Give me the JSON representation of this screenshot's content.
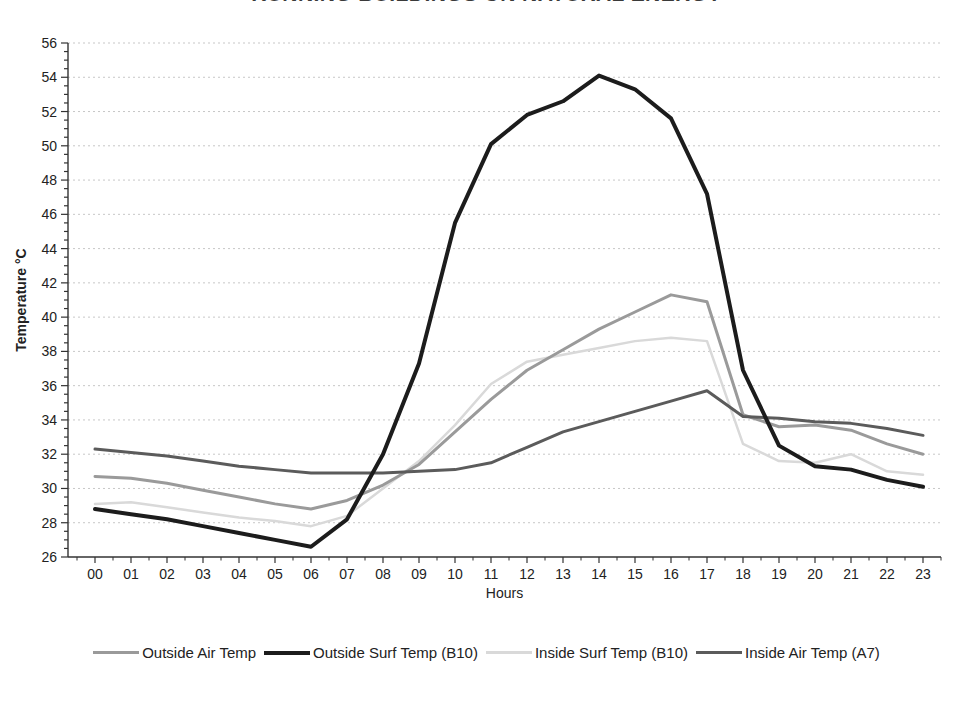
{
  "title": "RUNNING BUILDINGS ON NATURAL ENERGY",
  "chart_data": {
    "type": "line",
    "title": "RUNNING BUILDINGS ON NATURAL ENERGY",
    "xlabel": "Hours",
    "ylabel": "Temperature °C",
    "ylim": [
      26,
      56
    ],
    "ytick_step": 2,
    "yticks": [
      26,
      28,
      30,
      32,
      34,
      36,
      38,
      40,
      42,
      44,
      46,
      48,
      50,
      52,
      54,
      56
    ],
    "x": [
      "00",
      "01",
      "02",
      "03",
      "04",
      "05",
      "06",
      "07",
      "08",
      "09",
      "10",
      "11",
      "12",
      "13",
      "14",
      "15",
      "16",
      "17",
      "18",
      "19",
      "20",
      "21",
      "22",
      "23"
    ],
    "grid": "horizontal-dashed",
    "legend_position": "bottom",
    "colors": {
      "grid": "#c7c7c7",
      "axis": "#333333",
      "text": "#222222"
    },
    "series": [
      {
        "name": "Outside Air Temp",
        "color": "#9a9a9a",
        "width": 3,
        "values": [
          30.7,
          30.6,
          30.3,
          29.9,
          29.5,
          29.1,
          28.8,
          29.3,
          30.2,
          31.4,
          33.3,
          35.2,
          36.9,
          38.1,
          39.3,
          40.3,
          41.3,
          40.9,
          34.3,
          33.6,
          33.7,
          33.4,
          32.6,
          32.0
        ]
      },
      {
        "name": "Outside Surf Temp (B10)",
        "color": "#1c1c1c",
        "width": 4,
        "values": [
          28.8,
          28.5,
          28.2,
          27.8,
          27.4,
          27.0,
          26.6,
          28.2,
          32.0,
          37.3,
          45.5,
          50.1,
          51.8,
          52.6,
          54.1,
          53.3,
          51.6,
          47.2,
          36.9,
          32.5,
          31.3,
          31.1,
          30.5,
          30.1
        ]
      },
      {
        "name": "Inside Surf Temp (B10)",
        "color": "#d9d9d9",
        "width": 2.5,
        "values": [
          29.1,
          29.2,
          28.9,
          28.6,
          28.3,
          28.1,
          27.8,
          28.4,
          30.0,
          31.6,
          33.7,
          36.1,
          37.4,
          37.8,
          38.2,
          38.6,
          38.8,
          38.6,
          32.6,
          31.6,
          31.5,
          32.0,
          31.0,
          30.8
        ]
      },
      {
        "name": "Inside Air Temp (A7)",
        "color": "#5b5b5b",
        "width": 3,
        "values": [
          32.3,
          32.1,
          31.9,
          31.6,
          31.3,
          31.1,
          30.9,
          30.9,
          30.9,
          31.0,
          31.1,
          31.5,
          32.4,
          33.3,
          33.9,
          34.5,
          35.1,
          35.7,
          34.2,
          34.1,
          33.9,
          33.8,
          33.5,
          33.1
        ]
      }
    ]
  }
}
